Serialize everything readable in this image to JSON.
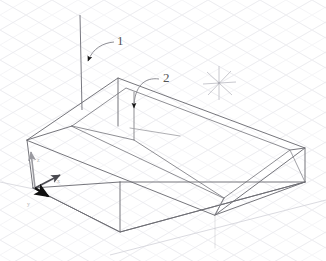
{
  "viewport": {
    "name": "cad-3d-viewport",
    "background_color": "#ffffff",
    "grid_color": "#ececf0",
    "grid_visible": true,
    "geometry_line_color": "#6e6e74",
    "projection": "isometric"
  },
  "annotations": {
    "callouts": [
      {
        "label": "1",
        "label_x": 120,
        "label_y": 40,
        "leader_start_x": 112,
        "leader_start_y": 43,
        "leader_ctrl_x": 100,
        "leader_ctrl_y": 45,
        "leader_end_x": 87,
        "leader_end_y": 62,
        "target": "vertical-reference-line"
      },
      {
        "label": "2",
        "label_x": 166,
        "label_y": 78,
        "leader_start_x": 157,
        "leader_start_y": 80,
        "leader_ctrl_x": 140,
        "leader_ctrl_y": 80,
        "leader_end_x": 134,
        "leader_end_y": 110,
        "target": "inner-wall-edge"
      }
    ]
  },
  "cursor": {
    "type": "star-crosshair-cursor",
    "x": 219,
    "y": 83,
    "color": "#c2c2c8",
    "rays": 6,
    "radius": 17
  },
  "axis_gizmo": {
    "name": "origin-axis-gizmo",
    "origin_x": 35,
    "origin_y": 188,
    "axes": [
      {
        "name": "z-axis",
        "label": "z",
        "dx": -4,
        "dy": -38,
        "color": "#9a9aa0",
        "label_x": 38,
        "label_y": 161
      },
      {
        "name": "x-axis",
        "label": "x",
        "dx": 26,
        "dy": -14,
        "color": "#6b6b71",
        "label_x": 57,
        "label_y": 182
      },
      {
        "name": "y-axis",
        "label": "y",
        "dx": 14,
        "dy": 8,
        "color": "#1b1b1b",
        "label_x": 30,
        "label_y": 205
      }
    ]
  },
  "solid": {
    "name": "tray-box-solid",
    "description": "open-top rectangular tray wireframe",
    "outer_top": [
      [
        27,
        140
      ],
      [
        118,
        78
      ],
      [
        305,
        148
      ],
      [
        215,
        215
      ]
    ],
    "outer_bottom": [
      [
        33,
        188
      ],
      [
        120,
        232
      ],
      [
        305,
        182
      ]
    ],
    "inner_top": [
      [
        72,
        126
      ],
      [
        126,
        88
      ],
      [
        290,
        150
      ],
      [
        224,
        198
      ]
    ],
    "inner_floor_y_offset": 14
  },
  "reference_lines": [
    {
      "name": "vertical-reference-line",
      "x1": 81,
      "y1": 15,
      "x2": 81,
      "y2": 108
    },
    {
      "name": "inner-floor-hint-line",
      "x1": 130,
      "y1": 128,
      "x2": 178,
      "y2": 136
    },
    {
      "name": "ground-trace-line",
      "x1": 110,
      "y1": 255,
      "x2": 326,
      "y2": 202
    }
  ]
}
